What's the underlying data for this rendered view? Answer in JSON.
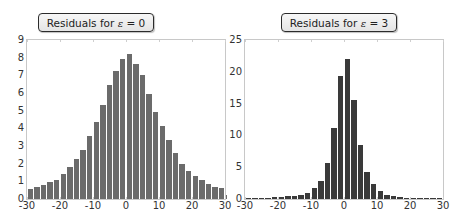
{
  "chart_data": [
    {
      "type": "bar",
      "title": "Residuals for ε = 0",
      "title_prefix": "Residuals for ",
      "title_symbol": "ε",
      "title_suffix": " = 0",
      "xlabel": "",
      "ylabel": "",
      "xlim": [
        -30,
        30
      ],
      "ylim": [
        0,
        9
      ],
      "xticks": [
        "-30",
        "-20",
        "-10",
        "0",
        "10",
        "20",
        "30"
      ],
      "yticks": [
        "0",
        "1",
        "2",
        "3",
        "4",
        "5",
        "6",
        "7",
        "8",
        "9"
      ],
      "bin_width": 2,
      "bar_color": "#6b6b6b",
      "bin_starts": [
        -30,
        -28,
        -26,
        -24,
        -22,
        -20,
        -18,
        -16,
        -14,
        -12,
        -10,
        -8,
        -6,
        -4,
        -2,
        0,
        2,
        4,
        6,
        8,
        10,
        12,
        14,
        16,
        18,
        20,
        22,
        24,
        26,
        28,
        30
      ],
      "values": [
        0.55,
        0.7,
        0.8,
        0.95,
        1.05,
        1.4,
        1.8,
        2.25,
        2.75,
        3.55,
        4.35,
        5.3,
        6.45,
        7.25,
        7.9,
        8.2,
        7.65,
        7.0,
        5.95,
        4.95,
        4.15,
        3.35,
        2.6,
        2.0,
        1.6,
        1.3,
        1.1,
        0.85,
        0.7,
        0.6,
        0.2
      ],
      "grid": false
    },
    {
      "type": "bar",
      "title": "Residuals for ε = 3",
      "title_prefix": "Residuals for ",
      "title_symbol": "ε",
      "title_suffix": " = 3",
      "xlabel": "",
      "ylabel": "",
      "xlim": [
        -30,
        30
      ],
      "ylim": [
        0,
        25
      ],
      "xticks": [
        "-30",
        "-20",
        "-10",
        "0",
        "10",
        "20",
        "30"
      ],
      "yticks": [
        "0",
        "5",
        "10",
        "15",
        "20",
        "25"
      ],
      "bin_width": 2,
      "bar_color": "#3a3a3a",
      "bin_starts": [
        -30,
        -28,
        -26,
        -24,
        -22,
        -20,
        -18,
        -16,
        -14,
        -12,
        -10,
        -8,
        -6,
        -4,
        -2,
        0,
        2,
        4,
        6,
        8,
        10,
        12,
        14,
        16,
        18,
        20,
        22,
        24,
        26,
        28
      ],
      "values": [
        0.1,
        0.1,
        0.15,
        0.2,
        0.25,
        0.3,
        0.4,
        0.5,
        0.6,
        1.0,
        1.7,
        2.9,
        5.7,
        11.2,
        19.3,
        22.0,
        15.5,
        8.5,
        4.2,
        2.3,
        1.2,
        0.6,
        0.4,
        0.25,
        0.2,
        0.15,
        0.1,
        0.1,
        0.1,
        0.1
      ],
      "grid": false
    }
  ]
}
